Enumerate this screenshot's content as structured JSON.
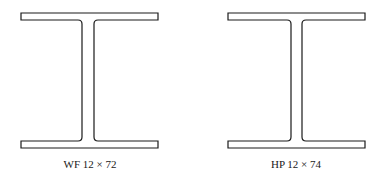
{
  "figure": {
    "sections": [
      {
        "id": "wf",
        "label": "WF 12 × 72",
        "type": "wide-flange"
      },
      {
        "id": "hp",
        "label": "HP 12 × 74",
        "type": "h-pile"
      }
    ],
    "stroke_color": "#1a1a1a",
    "background": "#ffffff"
  }
}
